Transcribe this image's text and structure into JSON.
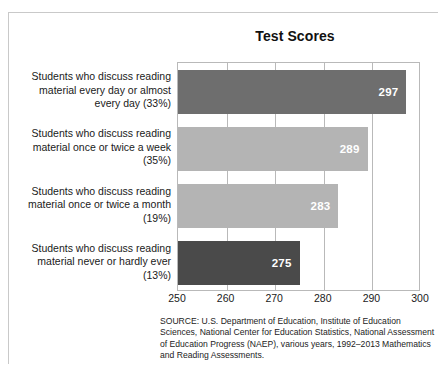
{
  "chart_data": {
    "type": "bar",
    "orientation": "horizontal",
    "title": "Test Scores",
    "xlabel": "",
    "ylabel": "",
    "xlim": [
      250,
      300
    ],
    "grid": true,
    "legend": "none",
    "categories": [
      "Students who discuss reading material every day or almost every day (33%)",
      "Students who discuss reading material once or twice a week (35%)",
      "Students who discuss reading material once or twice a month (19%)",
      "Students who discuss reading material never or hardly ever (13%)"
    ],
    "values": [
      297,
      289,
      283,
      275
    ],
    "value_labels": [
      "297",
      "289",
      "283",
      "275"
    ],
    "bar_colors": [
      "#6e6e6e",
      "#b4b4b4",
      "#b4b4b4",
      "#4a4a4a"
    ],
    "tick_labels": [
      "250",
      "260",
      "270",
      "280",
      "290",
      "300"
    ],
    "tick_values": [
      250,
      260,
      270,
      280,
      290,
      300
    ]
  },
  "source": {
    "note": "SOURCE: U.S. Department of Education, Institute of Education Sciences, National Center for Education Statistics, National Assessment of Education Progress (NAEP), various years, 1992–2013 Mathematics and Reading Assessments."
  }
}
